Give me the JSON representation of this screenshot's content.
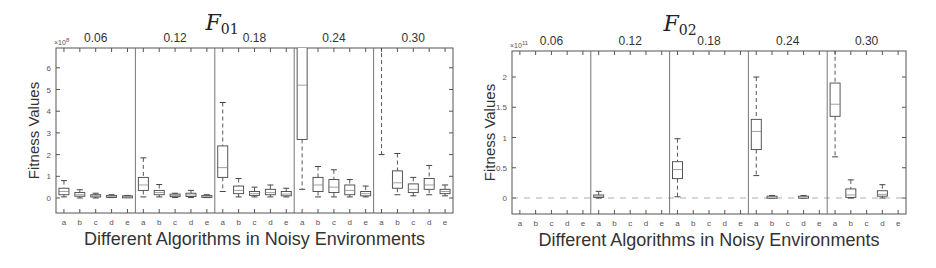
{
  "chart_data": [
    {
      "type": "box",
      "title": "F01",
      "title_main": "F",
      "title_sub": "01",
      "xlabel": "Different Algorithms in Noisy Environments",
      "ylabel": "Fitness Values",
      "y_multiplier": "×10^8",
      "y_multiplier_base": "×10",
      "y_multiplier_exp": "8",
      "ylim": [
        -0.7,
        6.8
      ],
      "yticks": [
        0,
        1,
        2,
        3,
        4,
        5,
        6
      ],
      "groups": [
        "0.06",
        "0.12",
        "0.18",
        "0.24",
        "0.30"
      ],
      "categories": [
        "a",
        "b",
        "c",
        "d",
        "e"
      ],
      "grid": false,
      "series": [
        {
          "group": "0.06",
          "boxes": [
            {
              "cat": "a",
              "lo": 0.05,
              "q1": 0.15,
              "med": 0.3,
              "q3": 0.45,
              "hi": 0.8
            },
            {
              "cat": "b",
              "lo": 0.0,
              "q1": 0.08,
              "med": 0.15,
              "q3": 0.25,
              "hi": 0.38
            },
            {
              "cat": "c",
              "lo": 0.0,
              "q1": 0.05,
              "med": 0.1,
              "q3": 0.15,
              "hi": 0.22
            },
            {
              "cat": "d",
              "lo": 0.02,
              "q1": 0.05,
              "med": 0.08,
              "q3": 0.12,
              "hi": 0.15
            },
            {
              "cat": "e",
              "lo": 0.02,
              "q1": 0.04,
              "med": 0.07,
              "q3": 0.1,
              "hi": 0.12
            }
          ]
        },
        {
          "group": "0.12",
          "boxes": [
            {
              "cat": "a",
              "lo": 0.05,
              "q1": 0.35,
              "med": 0.6,
              "q3": 0.95,
              "hi": 1.85
            },
            {
              "cat": "b",
              "lo": 0.05,
              "q1": 0.15,
              "med": 0.25,
              "q3": 0.35,
              "hi": 0.62
            },
            {
              "cat": "c",
              "lo": 0.02,
              "q1": 0.06,
              "med": 0.12,
              "q3": 0.18,
              "hi": 0.22
            },
            {
              "cat": "d",
              "lo": 0.02,
              "q1": 0.07,
              "med": 0.14,
              "q3": 0.22,
              "hi": 0.35
            },
            {
              "cat": "e",
              "lo": 0.02,
              "q1": 0.04,
              "med": 0.08,
              "q3": 0.12,
              "hi": 0.15
            }
          ]
        },
        {
          "group": "0.18",
          "boxes": [
            {
              "cat": "a",
              "lo": 0.3,
              "q1": 0.95,
              "med": 1.4,
              "q3": 2.4,
              "hi": 4.4
            },
            {
              "cat": "b",
              "lo": 0.05,
              "q1": 0.2,
              "med": 0.35,
              "q3": 0.55,
              "hi": 0.9
            },
            {
              "cat": "c",
              "lo": 0.05,
              "q1": 0.12,
              "med": 0.2,
              "q3": 0.3,
              "hi": 0.5
            },
            {
              "cat": "d",
              "lo": 0.05,
              "q1": 0.15,
              "med": 0.25,
              "q3": 0.4,
              "hi": 0.6
            },
            {
              "cat": "e",
              "lo": 0.05,
              "q1": 0.1,
              "med": 0.18,
              "q3": 0.3,
              "hi": 0.45
            }
          ]
        },
        {
          "group": "0.24",
          "boxes": [
            {
              "cat": "a",
              "lo": 0.4,
              "q1": 2.7,
              "med": 5.2,
              "q3": 7.5,
              "hi": 7.5
            },
            {
              "cat": "b",
              "lo": 0.05,
              "q1": 0.3,
              "med": 0.6,
              "q3": 0.95,
              "hi": 1.45
            },
            {
              "cat": "c",
              "lo": 0.05,
              "q1": 0.25,
              "med": 0.5,
              "q3": 0.85,
              "hi": 1.3
            },
            {
              "cat": "d",
              "lo": 0.05,
              "q1": 0.15,
              "med": 0.35,
              "q3": 0.6,
              "hi": 0.85
            },
            {
              "cat": "e",
              "lo": 0.05,
              "q1": 0.1,
              "med": 0.2,
              "q3": 0.3,
              "hi": 0.55
            }
          ]
        },
        {
          "group": "0.30",
          "boxes": [
            {
              "cat": "a",
              "lo": 2.0,
              "q1": 7.0,
              "med": 7.2,
              "q3": 7.5,
              "hi": 7.5
            },
            {
              "cat": "b",
              "lo": 0.15,
              "q1": 0.45,
              "med": 0.7,
              "q3": 1.25,
              "hi": 2.05
            },
            {
              "cat": "c",
              "lo": 0.1,
              "q1": 0.25,
              "med": 0.4,
              "q3": 0.65,
              "hi": 0.95
            },
            {
              "cat": "d",
              "lo": 0.15,
              "q1": 0.4,
              "med": 0.6,
              "q3": 0.9,
              "hi": 1.5
            },
            {
              "cat": "e",
              "lo": 0.1,
              "q1": 0.2,
              "med": 0.3,
              "q3": 0.4,
              "hi": 0.6
            }
          ]
        }
      ]
    },
    {
      "type": "box",
      "title": "F02",
      "title_main": "F",
      "title_sub": "02",
      "xlabel": "Different Algorithms in Noisy Environments",
      "ylabel": "Fitness Values",
      "y_multiplier": "×10^11",
      "y_multiplier_base": "×10",
      "y_multiplier_exp": "11",
      "ylim": [
        -0.5,
        2.4
      ],
      "yticks": [
        0,
        0.5,
        1,
        1.5,
        2
      ],
      "groups": [
        "0.06",
        "0.12",
        "0.18",
        "0.24",
        "0.30"
      ],
      "categories": [
        "a",
        "b",
        "c",
        "d",
        "e"
      ],
      "grid": false,
      "series": [
        {
          "group": "0.06",
          "boxes": [
            {
              "cat": "a",
              "lo": 0,
              "q1": 0,
              "med": 0,
              "q3": 0,
              "hi": 0,
              "flat": true
            },
            {
              "cat": "b",
              "lo": 0,
              "q1": 0,
              "med": 0,
              "q3": 0,
              "hi": 0,
              "flat": true
            },
            {
              "cat": "c",
              "lo": 0,
              "q1": 0,
              "med": 0,
              "q3": 0,
              "hi": 0,
              "flat": true
            },
            {
              "cat": "d",
              "lo": 0,
              "q1": 0,
              "med": 0,
              "q3": 0,
              "hi": 0,
              "flat": true
            },
            {
              "cat": "e",
              "lo": 0,
              "q1": 0,
              "med": 0,
              "q3": 0,
              "hi": 0,
              "flat": true
            }
          ]
        },
        {
          "group": "0.12",
          "boxes": [
            {
              "cat": "a",
              "lo": 0.0,
              "q1": 0.01,
              "med": 0.03,
              "q3": 0.05,
              "hi": 0.11
            },
            {
              "cat": "b",
              "lo": 0,
              "q1": 0,
              "med": 0,
              "q3": 0,
              "hi": 0,
              "flat": true
            },
            {
              "cat": "c",
              "lo": 0,
              "q1": 0,
              "med": 0,
              "q3": 0,
              "hi": 0,
              "flat": true
            },
            {
              "cat": "d",
              "lo": 0,
              "q1": 0,
              "med": 0,
              "q3": 0,
              "hi": 0,
              "flat": true
            },
            {
              "cat": "e",
              "lo": 0,
              "q1": 0,
              "med": 0,
              "q3": 0,
              "hi": 0,
              "flat": true
            }
          ]
        },
        {
          "group": "0.18",
          "boxes": [
            {
              "cat": "a",
              "lo": 0.02,
              "q1": 0.32,
              "med": 0.47,
              "q3": 0.6,
              "hi": 0.98
            },
            {
              "cat": "b",
              "lo": 0,
              "q1": 0,
              "med": 0,
              "q3": 0,
              "hi": 0,
              "flat": true
            },
            {
              "cat": "c",
              "lo": 0,
              "q1": 0,
              "med": 0,
              "q3": 0,
              "hi": 0,
              "flat": true
            },
            {
              "cat": "d",
              "lo": 0,
              "q1": 0,
              "med": 0,
              "q3": 0,
              "hi": 0,
              "flat": true
            },
            {
              "cat": "e",
              "lo": 0,
              "q1": 0,
              "med": 0,
              "q3": 0,
              "hi": 0,
              "flat": true
            }
          ]
        },
        {
          "group": "0.24",
          "boxes": [
            {
              "cat": "a",
              "lo": 0.37,
              "q1": 0.8,
              "med": 1.1,
              "q3": 1.3,
              "hi": 2.0
            },
            {
              "cat": "b",
              "lo": 0.0,
              "q1": 0.01,
              "med": 0.02,
              "q3": 0.03,
              "hi": 0.04
            },
            {
              "cat": "c",
              "lo": 0,
              "q1": 0,
              "med": 0,
              "q3": 0,
              "hi": 0,
              "flat": true
            },
            {
              "cat": "d",
              "lo": 0.0,
              "q1": 0.01,
              "med": 0.02,
              "q3": 0.03,
              "hi": 0.04
            },
            {
              "cat": "e",
              "lo": 0,
              "q1": 0,
              "med": 0,
              "q3": 0,
              "hi": 0,
              "flat": true
            }
          ]
        },
        {
          "group": "0.30",
          "boxes": [
            {
              "cat": "a",
              "lo": 0.68,
              "q1": 1.35,
              "med": 1.55,
              "q3": 1.9,
              "hi": 2.45
            },
            {
              "cat": "b",
              "lo": 0.0,
              "q1": 0.01,
              "med": 0.05,
              "q3": 0.15,
              "hi": 0.3
            },
            {
              "cat": "c",
              "lo": 0,
              "q1": 0,
              "med": 0,
              "q3": 0,
              "hi": 0,
              "flat": true
            },
            {
              "cat": "d",
              "lo": 0.0,
              "q1": 0.03,
              "med": 0.06,
              "q3": 0.12,
              "hi": 0.22
            },
            {
              "cat": "e",
              "lo": 0,
              "q1": 0,
              "med": 0,
              "q3": 0,
              "hi": 0,
              "flat": true
            }
          ]
        }
      ]
    }
  ],
  "layout": {
    "panels": [
      {
        "left": 56,
        "right": 453,
        "top": 48,
        "bottom": 213,
        "zero_y": 198,
        "px_per_unit": 21.7,
        "title_x": 222,
        "title_y": 30
      },
      {
        "left": 512,
        "right": 906,
        "top": 51,
        "bottom": 214,
        "zero_y": 198,
        "px_per_unit": 60.5,
        "title_x": 680,
        "title_y": 31
      }
    ]
  }
}
